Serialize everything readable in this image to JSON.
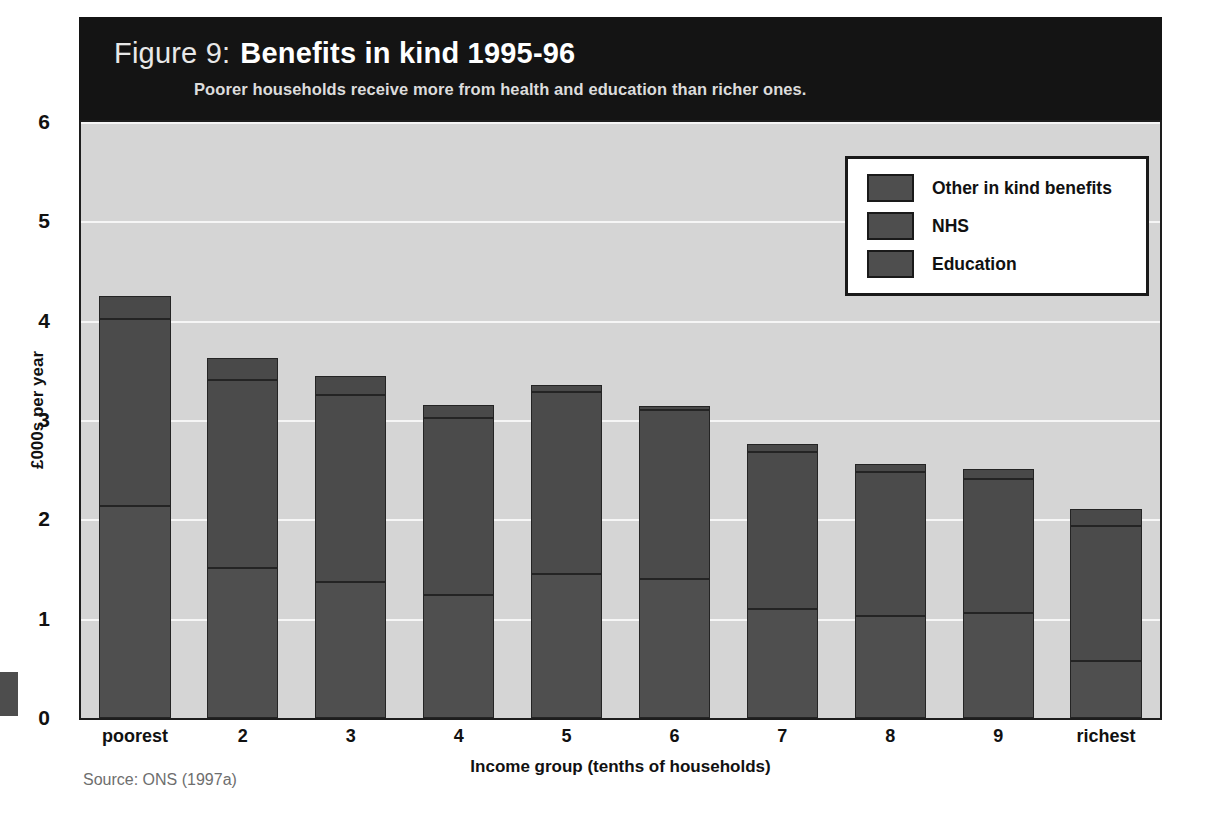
{
  "figure": {
    "label": "Figure 9:",
    "title": "Benefits in kind 1995-96",
    "subtitle": "Poorer households receive more from health and education than richer ones.",
    "source": "Source: ONS (1997a)"
  },
  "colors": {
    "header_background": "#141414",
    "plot_background": "#d5d5d5",
    "gridline": "#f6f6f6",
    "bar_education": "#4f4f4f",
    "bar_nhs": "#4b4b4b",
    "bar_other": "#494949",
    "outline": "#1d1d1d",
    "legend_background": "#ffffff"
  },
  "legend": {
    "entries": [
      {
        "label": "Other in kind benefits",
        "swatch": "#4e4e4e"
      },
      {
        "label": "NHS",
        "swatch": "#4e4e4e"
      },
      {
        "label": "Education",
        "swatch": "#4e4e4e"
      }
    ]
  },
  "chart_data": {
    "type": "bar",
    "stacked": true,
    "title": "Benefits in kind 1995-96",
    "subtitle": "Poorer households receive more from health and education than richer ones.",
    "xlabel": "Income group (tenths of households)",
    "ylabel": "£000s per year",
    "ylim": [
      0,
      6
    ],
    "yticks": [
      0,
      1,
      2,
      3,
      4,
      5,
      6
    ],
    "ytick_labels": [
      "0",
      "1",
      "2",
      "3",
      "4",
      "5",
      "6"
    ],
    "grid": true,
    "legend_position": "top-right",
    "categories": [
      "poorest",
      "2",
      "3",
      "4",
      "5",
      "6",
      "7",
      "8",
      "9",
      "richest"
    ],
    "series": [
      {
        "name": "Education",
        "values": [
          2.13,
          1.51,
          1.37,
          1.24,
          1.45,
          1.4,
          1.1,
          1.03,
          1.06,
          0.57
        ]
      },
      {
        "name": "NHS",
        "values": [
          1.89,
          1.89,
          1.88,
          1.78,
          1.83,
          1.7,
          1.58,
          1.45,
          1.35,
          1.36
        ]
      },
      {
        "name": "Other in kind benefits",
        "values": [
          0.23,
          0.22,
          0.19,
          0.13,
          0.07,
          0.04,
          0.08,
          0.08,
          0.1,
          0.17
        ]
      }
    ],
    "totals": [
      4.25,
      3.62,
      3.44,
      3.15,
      3.35,
      3.14,
      2.76,
      2.56,
      2.51,
      2.1
    ]
  },
  "axes": {
    "ytick_labels": [
      "6",
      "5",
      "4",
      "3",
      "2",
      "1",
      "0"
    ],
    "xtick_labels": [
      "poorest",
      "2",
      "3",
      "4",
      "5",
      "6",
      "7",
      "8",
      "9",
      "richest"
    ],
    "xlabel": "Income group (tenths of households)",
    "ylabel": "£000s per year"
  }
}
